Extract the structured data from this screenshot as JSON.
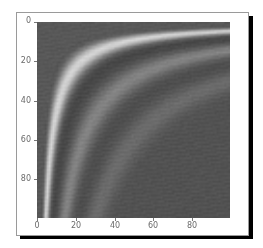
{
  "chart_data": {
    "type": "heatmap",
    "title": "",
    "xlabel": "",
    "ylabel": "",
    "colormap": "gray",
    "origin": "upper",
    "xlim": [
      0,
      100
    ],
    "ylim": [
      100,
      0
    ],
    "x_ticks": [
      0,
      20,
      40,
      60,
      80
    ],
    "y_ticks": [
      0,
      20,
      40,
      60,
      80
    ],
    "x_tick_labels": [
      "0",
      "20",
      "40",
      "60",
      "80"
    ],
    "y_tick_labels": [
      "0",
      "20",
      "40",
      "60",
      "80"
    ],
    "grid": false,
    "legend": null,
    "bands": [
      {
        "sqrt_xy_center": 21.5,
        "width": 3.2,
        "intensity": 1.0,
        "x_at_y99": 4.5,
        "y_at_x99": 5
      },
      {
        "sqrt_xy_center": 38.0,
        "width": 4.0,
        "intensity": 0.38,
        "x_at_y99": 18,
        "y_at_x99": 14
      },
      {
        "sqrt_xy_center": 55.0,
        "width": 4.5,
        "intensity": 0.2,
        "x_at_y99": 32,
        "y_at_x99": 30
      }
    ],
    "dark_troughs": [
      {
        "sqrt_xy_center": 29.0,
        "width": 3.5,
        "depth": 0.35
      },
      {
        "sqrt_xy_center": 46.5,
        "width": 4.0,
        "depth": 0.15
      }
    ],
    "background_gray": 82,
    "peak_gray": 212,
    "dark_gray": 48,
    "grid_size": [
      100,
      100
    ]
  },
  "figure": {
    "frame_color": "#9a9a9a",
    "shadow_color": "#000000",
    "tick_label_color": "#6a6a6a"
  }
}
